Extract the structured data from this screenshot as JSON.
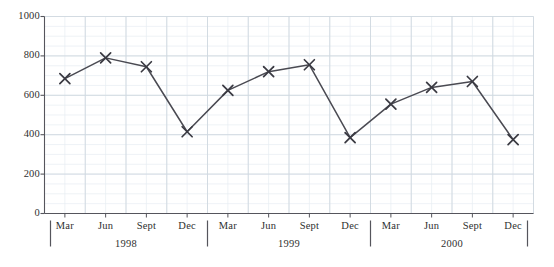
{
  "chart_data": {
    "type": "line",
    "title": "",
    "subtitle": "",
    "xlabel": "",
    "ylabel": "",
    "ylim": [
      0,
      1000
    ],
    "y_ticks": [
      0,
      200,
      400,
      600,
      800,
      1000
    ],
    "y_tick_labels": [
      "0",
      "200",
      "400",
      "600",
      "800",
      "1000"
    ],
    "grid": true,
    "minor_grid": true,
    "legend": null,
    "marker": "x",
    "line_color": "#4a4a52",
    "marker_color": "#3a3a42",
    "grid_color": "#cfd8e0",
    "minor_grid_color": "#e7edf2",
    "axis_color": "#55555c",
    "categories": [
      "Mar",
      "Jun",
      "Sept",
      "Dec",
      "Mar",
      "Jun",
      "Sept",
      "Dec",
      "Mar",
      "Jun",
      "Sept",
      "Dec"
    ],
    "groups": [
      {
        "label": "1998",
        "categories": [
          "Mar",
          "Jun",
          "Sept",
          "Dec"
        ]
      },
      {
        "label": "1999",
        "categories": [
          "Mar",
          "Jun",
          "Sept",
          "Dec"
        ]
      },
      {
        "label": "2000",
        "categories": [
          "Mar",
          "Jun",
          "Sept",
          "Dec"
        ]
      }
    ],
    "values": [
      685,
      790,
      745,
      415,
      625,
      720,
      755,
      385,
      555,
      640,
      670,
      375
    ],
    "points": [
      {
        "group": "1998",
        "category": "Mar",
        "value": 685
      },
      {
        "group": "1998",
        "category": "Jun",
        "value": 790
      },
      {
        "group": "1998",
        "category": "Sept",
        "value": 745
      },
      {
        "group": "1998",
        "category": "Dec",
        "value": 415
      },
      {
        "group": "1999",
        "category": "Mar",
        "value": 625
      },
      {
        "group": "1999",
        "category": "Jun",
        "value": 720
      },
      {
        "group": "1999",
        "category": "Sept",
        "value": 755
      },
      {
        "group": "1999",
        "category": "Dec",
        "value": 385
      },
      {
        "group": "2000",
        "category": "Mar",
        "value": 555
      },
      {
        "group": "2000",
        "category": "Jun",
        "value": 640
      },
      {
        "group": "2000",
        "category": "Sept",
        "value": 670
      },
      {
        "group": "2000",
        "category": "Dec",
        "value": 375
      }
    ]
  }
}
